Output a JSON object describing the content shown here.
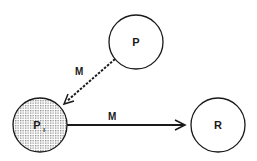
{
  "diagram": {
    "nodes": [
      {
        "id": "P",
        "label": "P",
        "subscript": "",
        "shaded": false
      },
      {
        "id": "PI",
        "label": "P",
        "subscript": "I",
        "shaded": true
      },
      {
        "id": "R",
        "label": "R",
        "subscript": "",
        "shaded": false
      }
    ],
    "edges": [
      {
        "from": "P",
        "to": "PI",
        "label": "M",
        "style": "dashed"
      },
      {
        "from": "PI",
        "to": "R",
        "label": "M",
        "style": "solid"
      }
    ],
    "colors": {
      "stroke": "#1a1a1a",
      "background": "#ffffff",
      "shade": "#9a9a9a"
    }
  }
}
